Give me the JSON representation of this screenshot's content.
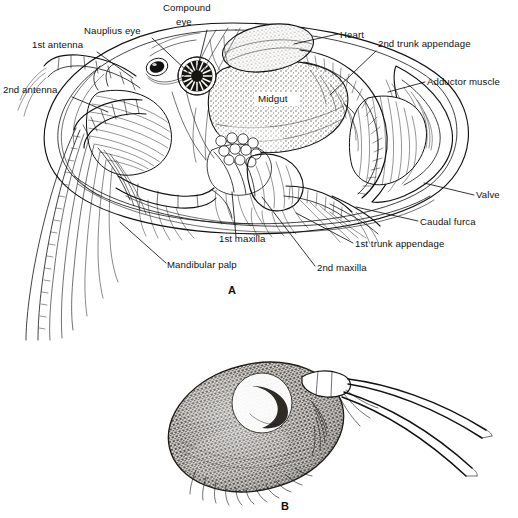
{
  "figure": {
    "panels": [
      {
        "id": "A",
        "letter": "A",
        "caption": "A",
        "description": "Lateral view of ostracod internal anatomy with left valve removed"
      },
      {
        "id": "B",
        "letter": "B",
        "caption": "B",
        "description": "External lateral view of whole ostracod with extended antennae"
      }
    ]
  },
  "labels": [
    {
      "key": "compound_eye",
      "text": "Compound",
      "text2": "eye",
      "x": 163,
      "y": 11,
      "x2": 176,
      "y2": 25,
      "anchor": "start",
      "leader": [
        [
          207,
          30
        ],
        [
          197,
          70
        ]
      ]
    },
    {
      "key": "nauplius_eye",
      "text": "Nauplius eye",
      "x": 84,
      "y": 34,
      "anchor": "start",
      "leader": [
        [
          152,
          38
        ],
        [
          188,
          72
        ]
      ]
    },
    {
      "key": "first_antenna",
      "text": "1st antenna",
      "x": 32,
      "y": 48,
      "anchor": "start",
      "leader": [
        [
          97,
          52
        ],
        [
          133,
          78
        ]
      ]
    },
    {
      "key": "second_antenna",
      "text": "2nd antenna",
      "x": 3,
      "y": 93,
      "anchor": "start",
      "leader": [
        [
          72,
          97
        ],
        [
          108,
          112
        ]
      ]
    },
    {
      "key": "heart",
      "text": "Heart",
      "x": 340,
      "y": 38,
      "anchor": "start",
      "leader": [
        [
          338,
          34
        ],
        [
          294,
          44
        ]
      ]
    },
    {
      "key": "second_trunk_append",
      "text": "2nd trunk appendage",
      "x": 378,
      "y": 47,
      "anchor": "start",
      "leader": [
        [
          376,
          51
        ],
        [
          330,
          95
        ]
      ]
    },
    {
      "key": "adductor_muscle",
      "text": "Adductor muscle",
      "x": 427,
      "y": 85,
      "anchor": "start",
      "leader": [
        [
          425,
          82
        ],
        [
          388,
          92
        ]
      ]
    },
    {
      "key": "valve",
      "text": "Valve",
      "x": 476,
      "y": 198,
      "anchor": "start",
      "leader": [
        [
          474,
          195
        ],
        [
          424,
          183
        ]
      ]
    },
    {
      "key": "caudal_furca",
      "text": "Caudal furca",
      "x": 420,
      "y": 225,
      "anchor": "start",
      "leader": [
        [
          418,
          221
        ],
        [
          356,
          207
        ]
      ]
    },
    {
      "key": "first_trunk_append",
      "text": "1st trunk appendage",
      "x": 355,
      "y": 247,
      "anchor": "start",
      "leader": [
        [
          353,
          243
        ],
        [
          296,
          213
        ]
      ]
    },
    {
      "key": "second_maxilla",
      "text": "2nd maxilla",
      "x": 317,
      "y": 271,
      "anchor": "start",
      "leader": [
        [
          315,
          266
        ],
        [
          262,
          197
        ]
      ]
    },
    {
      "key": "first_maxilla",
      "text": "1st maxilla",
      "x": 219,
      "y": 242,
      "anchor": "start",
      "leader": [
        [
          236,
          237
        ],
        [
          232,
          192
        ]
      ]
    },
    {
      "key": "mandibular_palp",
      "text": "Mandibular palp",
      "x": 167,
      "y": 268,
      "anchor": "start",
      "leader": [
        [
          166,
          263
        ],
        [
          120,
          222
        ]
      ]
    },
    {
      "key": "midgut",
      "text": "Midgut",
      "x": 258,
      "y": 102,
      "anchor": "start",
      "inline": true
    }
  ],
  "colors": {
    "ink": "#111111",
    "background": "#ffffff",
    "organ_shade": "#b9b3ab",
    "organ_shade_light": "#cfc9c1",
    "body_b_shade": "#5d5a55"
  }
}
